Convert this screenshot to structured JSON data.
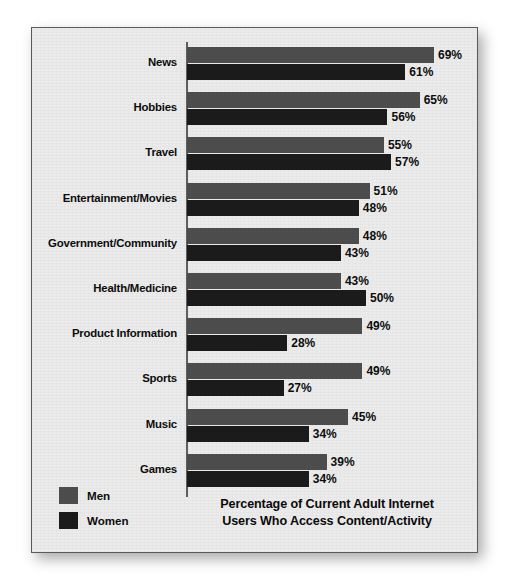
{
  "figure": {
    "background_color": "#ebebeb",
    "border_color": "#5a5a5a"
  },
  "legend": {
    "position": "bottom-left",
    "items": [
      {
        "label": "Men",
        "color": "#4d4d4d"
      },
      {
        "label": "Women",
        "color": "#1b1b1b"
      }
    ]
  },
  "title": {
    "line1": "Percentage of Current Adult Internet",
    "line2": "Users Who Access Content/Activity"
  },
  "chart_data": {
    "type": "bar",
    "orientation": "horizontal",
    "title": "Percentage of Current Adult Internet Users Who Access Content/Activity",
    "xlabel": "",
    "ylabel": "",
    "xlim": [
      0,
      69
    ],
    "grid": false,
    "legend_position": "bottom-left",
    "value_suffix": "%",
    "categories": [
      "News",
      "Hobbies",
      "Travel",
      "Entertainment/Movies",
      "Government/Community",
      "Health/Medicine",
      "Product Information",
      "Sports",
      "Music",
      "Games"
    ],
    "series": [
      {
        "name": "Men",
        "color": "#4d4d4d",
        "values": [
          69,
          65,
          55,
          51,
          48,
          43,
          49,
          49,
          45,
          39
        ],
        "labels": [
          "69%",
          "65%",
          "55%",
          "51%",
          "48%",
          "43%",
          "49%",
          "49%",
          "45%",
          "39%"
        ]
      },
      {
        "name": "Women",
        "color": "#1b1b1b",
        "values": [
          61,
          56,
          57,
          48,
          43,
          50,
          28,
          27,
          34,
          34
        ],
        "labels": [
          "61%",
          "56%",
          "57%",
          "48%",
          "43%",
          "50%",
          "28%",
          "27%",
          "34%",
          "34%"
        ]
      }
    ]
  }
}
